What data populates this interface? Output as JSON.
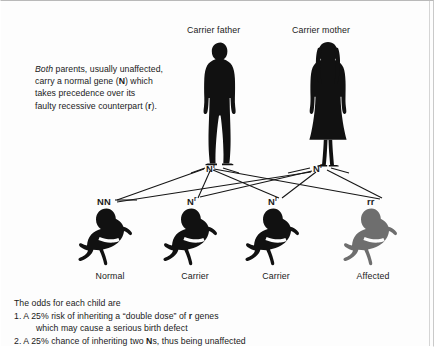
{
  "diagram": {
    "title_visible": false,
    "intro": {
      "emphasis": "Both",
      "line1_rest": " parents, usually unaffected,",
      "line2_a": "carry a normal gene (",
      "line2_gene": "N",
      "line2_b": ") which",
      "line3": "takes precedence over its",
      "line4_a": "faulty recessive counterpart (",
      "line4_gene": "r",
      "line4_b": ")."
    },
    "parents": [
      {
        "caption": "Carrier father",
        "genotype_main": "N",
        "genotype_sup": "r",
        "figure": "adult-male-silhouette",
        "color": "#111111"
      },
      {
        "caption": "Carrier mother",
        "genotype_main": "N",
        "genotype_sup": "r",
        "figure": "adult-female-silhouette",
        "color": "#111111"
      }
    ],
    "children": [
      {
        "caption": "Normal",
        "genotype_main": "NN",
        "genotype_sup": "",
        "figure": "baby-silhouette",
        "color": "#111111"
      },
      {
        "caption": "Carrier",
        "genotype_main": "N",
        "genotype_sup": "r",
        "figure": "baby-silhouette",
        "color": "#111111"
      },
      {
        "caption": "Carrier",
        "genotype_main": "N",
        "genotype_sup": "r",
        "figure": "baby-silhouette",
        "color": "#111111"
      },
      {
        "caption": "Affected",
        "genotype_main": "rr",
        "genotype_sup": "",
        "figure": "baby-silhouette",
        "color": "#6e6e6e"
      }
    ],
    "odds": {
      "heading": "The odds for each child are",
      "item1_a": "1. A 25% risk of inheriting a “double dose” of ",
      "item1_gene": "r",
      "item1_b": " genes",
      "item1_cont": "which may cause a serious birth defect",
      "item2_a": "2. A 25% chance of inheriting two ",
      "item2_gene": "N",
      "item2_b": "s, thus being unaffected"
    },
    "colors": {
      "background": "#fdfdfd",
      "figure_dark": "#111111",
      "figure_affected": "#6e6e6e",
      "line": "#161616",
      "border": "#c9c9c9"
    }
  }
}
